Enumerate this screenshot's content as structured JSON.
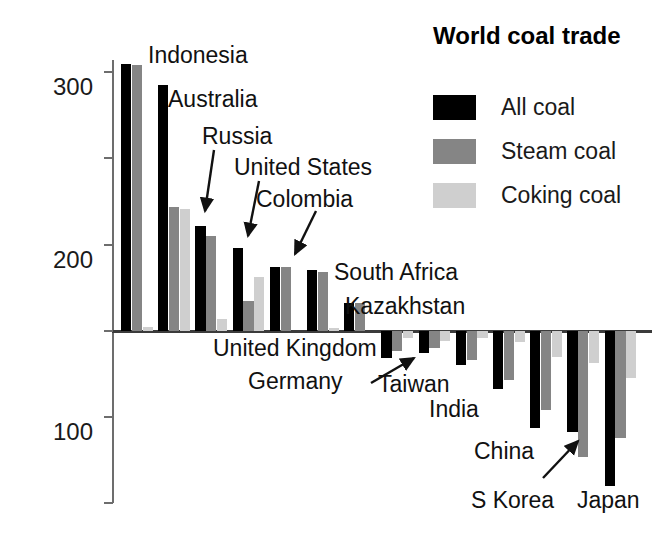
{
  "chart_data": {
    "type": "bar",
    "title": "World coal trade",
    "xlabel": "",
    "ylabel": "Millions of tonnes of coal",
    "ylim": [
      -200,
      320
    ],
    "yticks": [
      300,
      200,
      100,
      0,
      -100,
      -200
    ],
    "ytick_labels": [
      "300",
      "200",
      "100",
      "0",
      "–100",
      "–200"
    ],
    "grid": false,
    "legend_position": "top-right",
    "categories": [
      "Indonesia",
      "Australia",
      "Russia",
      "United States",
      "Colombia",
      "South Africa",
      "Kazakhstan",
      "United Kingdom",
      "Germany",
      "Taiwan",
      "India",
      "China",
      "S Korea",
      "Japan"
    ],
    "series": [
      {
        "name": "All coal",
        "color": "#000000",
        "values": [
          310,
          285,
          122,
          96,
          74,
          71,
          32,
          -32,
          -26,
          -40,
          -68,
          -113,
          -118,
          -180
        ]
      },
      {
        "name": "Steam coal",
        "color": "#858585",
        "values": [
          308,
          143,
          110,
          34,
          74,
          68,
          32,
          -24,
          -20,
          -34,
          -57,
          -92,
          -147,
          -125
        ]
      },
      {
        "name": "Coking coal",
        "color": "#cfcfcf",
        "values": [
          4,
          141,
          13,
          62,
          0,
          3,
          0,
          -8,
          -12,
          -9,
          -13,
          -30,
          -38,
          -55
        ]
      }
    ],
    "annotations": [
      {
        "label": "Indonesia",
        "arrow": false
      },
      {
        "label": "Australia",
        "arrow": false
      },
      {
        "label": "Russia",
        "arrow": true
      },
      {
        "label": "United States",
        "arrow": true
      },
      {
        "label": "Colombia",
        "arrow": true
      },
      {
        "label": "South Africa",
        "arrow": false
      },
      {
        "label": "Kazakhstan",
        "arrow": false
      },
      {
        "label": "United Kingdom",
        "arrow": false
      },
      {
        "label": "Germany",
        "arrow": false
      },
      {
        "label": "Taiwan",
        "arrow": true
      },
      {
        "label": "India",
        "arrow": false
      },
      {
        "label": "China",
        "arrow": false
      },
      {
        "label": "S Korea",
        "arrow": true
      },
      {
        "label": "Japan",
        "arrow": false
      }
    ]
  },
  "legend": {
    "title": "World coal trade",
    "items": [
      {
        "label": "All coal",
        "color": "#000000"
      },
      {
        "label": "Steam coal",
        "color": "#858585"
      },
      {
        "label": "Coking coal",
        "color": "#cfcfcf"
      }
    ]
  },
  "axis": {
    "y_title": "Millions of tonnes of coal",
    "ticks": [
      "300",
      "200",
      "100",
      "0",
      "–100",
      "–200"
    ]
  }
}
